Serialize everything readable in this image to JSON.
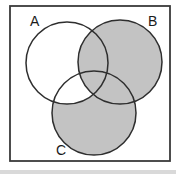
{
  "venn": {
    "sets": [
      {
        "label": "A",
        "shaded": false
      },
      {
        "label": "B",
        "shaded": true
      },
      {
        "label": "C",
        "shaded": true
      }
    ],
    "regions": {
      "A_only": "white",
      "B_only": "shaded",
      "C_only": "shaded",
      "A_and_B_only": "shaded",
      "A_and_C_only": "white",
      "B_and_C_only": "shaded",
      "A_and_B_and_C": "shaded",
      "outside_circles_inside_universe": "white"
    },
    "colors": {
      "shaded": "#c3c3c3",
      "background": "#ffffff",
      "line": "#2e2e2e",
      "label": "#1a1a1a",
      "scan_edge": "#d9d9d9"
    }
  }
}
